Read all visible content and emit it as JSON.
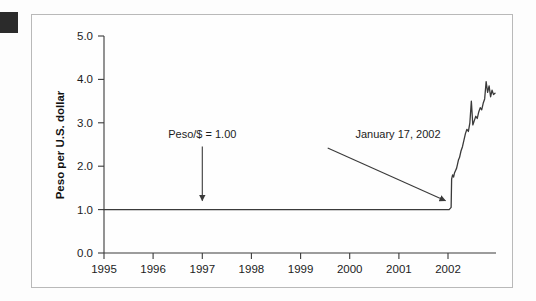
{
  "figure": {
    "background_color": "#fdfdfd",
    "frame_color": "#b9b9b9",
    "marker_color": "#2b2b2b",
    "line_color": "#3a3a3a",
    "text_color": "#1c1c1c"
  },
  "chart_data": {
    "type": "line",
    "title": "",
    "xlabel": "",
    "ylabel": "Peso per U.S. dollar",
    "xlim": [
      1995,
      2002.95
    ],
    "ylim": [
      0.0,
      5.0
    ],
    "grid": false,
    "legend": null,
    "xticks": [
      1995,
      1996,
      1997,
      1998,
      1999,
      2000,
      2001,
      2002
    ],
    "xticklabels": [
      "1995",
      "1996",
      "1997",
      "1998",
      "1999",
      "2000",
      "2001",
      "2002"
    ],
    "yticks": [
      0.0,
      1.0,
      2.0,
      3.0,
      4.0,
      5.0
    ],
    "yticklabels": [
      "0.0",
      "1.0",
      "2.0",
      "3.0",
      "4.0",
      "5.0"
    ],
    "series": [
      {
        "name": "Peso per U.S. dollar",
        "x": [
          1995.0,
          1995.5,
          1996.0,
          1996.5,
          1997.0,
          1997.5,
          1998.0,
          1998.5,
          1999.0,
          1999.5,
          2000.0,
          2000.5,
          2001.0,
          2001.5,
          2001.9,
          2002.0,
          2002.04,
          2002.05,
          2002.07,
          2002.09,
          2002.11,
          2002.13,
          2002.15,
          2002.17,
          2002.19,
          2002.21,
          2002.24,
          2002.27,
          2002.3,
          2002.33,
          2002.36,
          2002.39,
          2002.42,
          2002.45,
          2002.48,
          2002.51,
          2002.54,
          2002.57,
          2002.6,
          2002.63,
          2002.66,
          2002.69,
          2002.72,
          2002.75,
          2002.78,
          2002.81,
          2002.84,
          2002.87,
          2002.9,
          2002.93
        ],
        "y": [
          1.0,
          1.0,
          1.0,
          1.0,
          1.0,
          1.0,
          1.0,
          1.0,
          1.0,
          1.0,
          1.0,
          1.0,
          1.0,
          1.0,
          1.0,
          1.0,
          1.05,
          1.7,
          1.8,
          1.75,
          1.85,
          1.9,
          1.95,
          2.05,
          2.15,
          2.2,
          2.35,
          2.45,
          2.6,
          2.75,
          2.85,
          2.8,
          3.0,
          3.5,
          2.95,
          3.05,
          3.15,
          3.1,
          3.25,
          3.35,
          3.3,
          3.45,
          3.55,
          3.95,
          3.7,
          3.85,
          3.6,
          3.75,
          3.65,
          3.68
        ]
      }
    ],
    "annotations": [
      {
        "id": "peg-label",
        "text": "Peso/$ = 1.00",
        "text_x": 1997.0,
        "text_y": 2.62,
        "arrow_from_x": 1997.0,
        "arrow_from_y": 2.45,
        "arrow_to_x": 1997.0,
        "arrow_to_y": 1.05
      },
      {
        "id": "devaluation-label",
        "text": "January 17, 2002",
        "text_x": 2000.3,
        "text_y": 2.62,
        "arrow_from_x": 1999.55,
        "arrow_from_y": 2.42,
        "arrow_to_x": 2001.97,
        "arrow_to_y": 1.05
      }
    ]
  }
}
